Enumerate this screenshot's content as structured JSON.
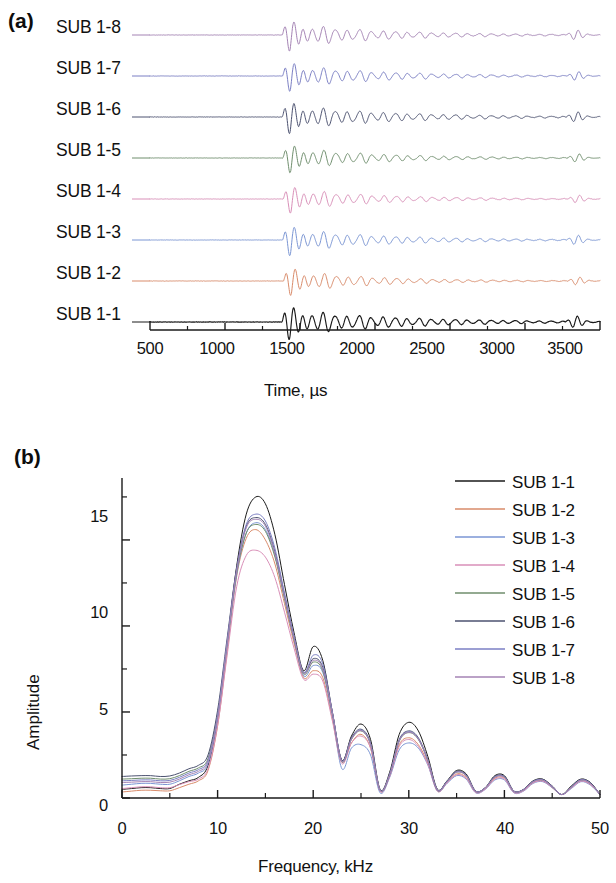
{
  "figure": {
    "panels": [
      {
        "id": "a",
        "label": "(a)",
        "type": "waveform-stack",
        "xlabel": "Time, µs",
        "x_ticks": [
          "500",
          "1000",
          "1500",
          "2000",
          "2500",
          "3000",
          "3500"
        ],
        "trace_labels": [
          "SUB 1-8",
          "SUB 1-7",
          "SUB 1-6",
          "SUB 1-5",
          "SUB 1-4",
          "SUB 1-3",
          "SUB 1-2",
          "SUB 1-1"
        ]
      },
      {
        "id": "b",
        "label": "(b)",
        "type": "spectrum",
        "xlabel": "Frequency, kHz",
        "ylabel": "Amplitude",
        "x_ticks": [
          "0",
          "10",
          "20",
          "30",
          "40",
          "50"
        ],
        "y_ticks": [
          "0",
          "5",
          "10",
          "15"
        ],
        "legend_labels": [
          "SUB 1-1",
          "SUB 1-2",
          "SUB 1-3",
          "SUB 1-4",
          "SUB 1-5",
          "SUB 1-6",
          "SUB 1-7",
          "SUB 1-8"
        ]
      }
    ]
  },
  "series_colors": {
    "SUB 1-1": "#1a1a1a",
    "SUB 1-2": "#d98b6a",
    "SUB 1-3": "#7b96d4",
    "SUB 1-4": "#d98fb8",
    "SUB 1-5": "#6f8e6d",
    "SUB 1-6": "#4c5270",
    "SUB 1-7": "#7b7fc4",
    "SUB 1-8": "#a483b4"
  },
  "chart_data": [
    {
      "type": "line",
      "panel": "a",
      "title": "(a)",
      "xlabel": "Time, µs",
      "ylabel": "",
      "xlim": [
        500,
        3500
      ],
      "xticks": [
        500,
        1000,
        1500,
        2000,
        2500,
        3000,
        3500
      ],
      "minor_xticks": [
        750,
        1250,
        1750,
        2250,
        2750,
        3250
      ],
      "grid": false,
      "legend": "none",
      "note": "Eight stacked ultrasonic A-scan waveforms, offset vertically; each trace is flat until a wave-packet arrival near 1380 µs, then a decaying coda, with a small reflection burst near 3300-3450 µs.",
      "series": [
        {
          "name": "SUB 1-8",
          "color": "#a483b4",
          "baseline_label_y": 25,
          "onset_us": 1380,
          "packet_peak_us": 1470,
          "peak_amp": 1.0,
          "coda_decay": 0.0016,
          "reflection_us": 3340,
          "reflection_amp": 0.17
        },
        {
          "name": "SUB 1-7",
          "color": "#7b7fc4",
          "baseline_label_y": 66,
          "onset_us": 1382,
          "packet_peak_us": 1472,
          "peak_amp": 0.96,
          "coda_decay": 0.0016,
          "reflection_us": 3345,
          "reflection_amp": 0.16
        },
        {
          "name": "SUB 1-6",
          "color": "#4c5270",
          "baseline_label_y": 107,
          "onset_us": 1380,
          "packet_peak_us": 1470,
          "peak_amp": 1.04,
          "coda_decay": 0.0015,
          "reflection_us": 3340,
          "reflection_amp": 0.18
        },
        {
          "name": "SUB 1-5",
          "color": "#6f8e6d",
          "baseline_label_y": 148,
          "onset_us": 1384,
          "packet_peak_us": 1474,
          "peak_amp": 0.92,
          "coda_decay": 0.0017,
          "reflection_us": 3348,
          "reflection_amp": 0.15
        },
        {
          "name": "SUB 1-4",
          "color": "#d98fb8",
          "baseline_label_y": 189,
          "onset_us": 1386,
          "packet_peak_us": 1476,
          "peak_amp": 0.88,
          "coda_decay": 0.0017,
          "reflection_us": 3350,
          "reflection_amp": 0.14
        },
        {
          "name": "SUB 1-3",
          "color": "#7b96d4",
          "baseline_label_y": 230,
          "onset_us": 1382,
          "packet_peak_us": 1472,
          "peak_amp": 0.98,
          "coda_decay": 0.0016,
          "reflection_us": 3342,
          "reflection_amp": 0.17
        },
        {
          "name": "SUB 1-2",
          "color": "#d98b6a",
          "baseline_label_y": 271,
          "onset_us": 1388,
          "packet_peak_us": 1478,
          "peak_amp": 0.9,
          "coda_decay": 0.0018,
          "reflection_us": 3352,
          "reflection_amp": 0.14
        },
        {
          "name": "SUB 1-1",
          "color": "#1a1a1a",
          "baseline_label_y": 312,
          "onset_us": 1378,
          "packet_peak_us": 1468,
          "peak_amp": 1.1,
          "coda_decay": 0.0014,
          "reflection_us": 3335,
          "reflection_amp": 0.2
        }
      ]
    },
    {
      "type": "line",
      "panel": "b",
      "title": "(b)",
      "xlabel": "Frequency, kHz",
      "ylabel": "Amplitude",
      "xlim": [
        0,
        50
      ],
      "ylim": [
        0,
        18.6
      ],
      "xticks": [
        0,
        10,
        20,
        30,
        40,
        50
      ],
      "minor_xticks": [
        5,
        15,
        25,
        35,
        45
      ],
      "yticks": [
        0,
        5,
        10,
        15
      ],
      "minor_yticks": [
        2.5,
        7.5,
        12.5,
        17.5
      ],
      "grid": false,
      "legend": "upper-right",
      "x": [
        0,
        1,
        2,
        3,
        4,
        5,
        6,
        7,
        8,
        9,
        10,
        11,
        12,
        13,
        14,
        15,
        16,
        17,
        18,
        19,
        20,
        21,
        22,
        23,
        24,
        25,
        26,
        27,
        28,
        29,
        30,
        31,
        32,
        33,
        34,
        35,
        36,
        37,
        38,
        39,
        40,
        41,
        42,
        43,
        44,
        45,
        46,
        47,
        48,
        49,
        50
      ],
      "series": [
        {
          "name": "SUB 1-1",
          "color": "#1a1a1a",
          "values": [
            0.5,
            0.55,
            0.6,
            0.6,
            0.55,
            0.55,
            0.8,
            1.0,
            1.2,
            1.9,
            4.6,
            9.0,
            13.5,
            16.5,
            17.5,
            17.1,
            15.3,
            12.4,
            9.6,
            7.4,
            8.8,
            8.0,
            5.0,
            2.2,
            3.6,
            4.3,
            3.4,
            0.5,
            1.5,
            3.7,
            4.4,
            3.9,
            2.4,
            0.5,
            1.0,
            1.6,
            1.4,
            0.4,
            0.6,
            1.3,
            1.3,
            0.4,
            0.5,
            1.0,
            1.1,
            0.7,
            0.2,
            0.7,
            1.1,
            0.9,
            0.2
          ]
        },
        {
          "name": "SUB 1-2",
          "color": "#d98b6a",
          "values": [
            0.35,
            0.4,
            0.45,
            0.45,
            0.42,
            0.42,
            0.6,
            0.8,
            1.0,
            1.6,
            4.2,
            8.5,
            12.9,
            15.1,
            15.6,
            15.0,
            13.6,
            11.3,
            9.0,
            7.0,
            7.4,
            7.0,
            4.6,
            2.1,
            3.2,
            3.7,
            2.9,
            0.4,
            1.3,
            3.1,
            3.5,
            3.1,
            2.0,
            0.4,
            0.9,
            1.4,
            1.2,
            0.35,
            0.55,
            1.15,
            1.15,
            0.35,
            0.45,
            0.9,
            1.0,
            0.6,
            0.2,
            0.6,
            1.0,
            0.8,
            0.2
          ]
        },
        {
          "name": "SUB 1-3",
          "color": "#7b96d4",
          "values": [
            0.75,
            0.8,
            0.85,
            0.85,
            0.8,
            0.8,
            1.0,
            1.25,
            1.45,
            2.0,
            4.6,
            8.8,
            13.0,
            15.4,
            16.0,
            15.6,
            14.1,
            11.6,
            9.2,
            7.1,
            7.7,
            7.3,
            4.8,
            1.7,
            2.9,
            3.1,
            2.5,
            0.3,
            1.2,
            2.8,
            3.2,
            2.9,
            1.9,
            0.4,
            0.85,
            1.3,
            1.1,
            0.3,
            0.5,
            1.05,
            1.05,
            0.3,
            0.4,
            0.85,
            0.95,
            0.6,
            0.2,
            0.55,
            0.95,
            0.75,
            0.2
          ]
        },
        {
          "name": "SUB 1-4",
          "color": "#d98fb8",
          "values": [
            0.55,
            0.6,
            0.65,
            0.65,
            0.6,
            0.6,
            0.78,
            0.95,
            1.1,
            1.7,
            4.2,
            8.3,
            12.3,
            14.1,
            14.4,
            14.0,
            12.8,
            10.8,
            8.7,
            6.9,
            7.2,
            6.8,
            4.5,
            2.0,
            3.2,
            3.6,
            2.9,
            0.4,
            1.25,
            3.0,
            3.4,
            3.0,
            1.95,
            0.4,
            0.88,
            1.35,
            1.15,
            0.32,
            0.52,
            1.1,
            1.1,
            0.32,
            0.42,
            0.88,
            0.98,
            0.62,
            0.2,
            0.58,
            0.98,
            0.78,
            0.2
          ]
        },
        {
          "name": "SUB 1-5",
          "color": "#6f8e6d",
          "values": [
            1.1,
            1.12,
            1.15,
            1.15,
            1.1,
            1.12,
            1.3,
            1.55,
            1.75,
            2.3,
            4.9,
            9.0,
            13.1,
            15.4,
            15.9,
            15.5,
            14.0,
            11.6,
            9.2,
            7.2,
            7.9,
            7.4,
            4.9,
            2.1,
            3.4,
            3.9,
            3.1,
            0.45,
            1.35,
            3.3,
            3.8,
            3.4,
            2.15,
            0.45,
            0.95,
            1.5,
            1.3,
            0.38,
            0.58,
            1.22,
            1.22,
            0.38,
            0.48,
            0.95,
            1.05,
            0.66,
            0.2,
            0.64,
            1.05,
            0.85,
            0.2
          ]
        },
        {
          "name": "SUB 1-6",
          "color": "#4c5270",
          "values": [
            1.25,
            1.28,
            1.3,
            1.3,
            1.25,
            1.28,
            1.45,
            1.7,
            1.9,
            2.5,
            5.1,
            9.3,
            13.4,
            15.8,
            16.3,
            15.9,
            14.3,
            11.8,
            9.3,
            7.3,
            8.1,
            7.6,
            5.0,
            2.2,
            3.5,
            4.0,
            3.2,
            0.47,
            1.4,
            3.4,
            3.9,
            3.5,
            2.2,
            0.47,
            0.98,
            1.55,
            1.35,
            0.4,
            0.6,
            1.25,
            1.25,
            0.4,
            0.5,
            0.98,
            1.08,
            0.68,
            0.2,
            0.66,
            1.08,
            0.88,
            0.2
          ]
        },
        {
          "name": "SUB 1-7",
          "color": "#7b7fc4",
          "values": [
            1.0,
            1.02,
            1.05,
            1.05,
            1.0,
            1.02,
            1.2,
            1.45,
            1.65,
            2.2,
            4.8,
            9.1,
            13.3,
            15.9,
            16.5,
            16.1,
            14.5,
            11.9,
            9.4,
            7.3,
            8.3,
            7.8,
            5.0,
            2.15,
            3.45,
            3.95,
            3.15,
            0.46,
            1.38,
            3.35,
            3.85,
            3.45,
            2.18,
            0.46,
            0.96,
            1.52,
            1.32,
            0.39,
            0.59,
            1.23,
            1.23,
            0.39,
            0.49,
            0.96,
            1.06,
            0.67,
            0.2,
            0.65,
            1.06,
            0.86,
            0.2
          ]
        },
        {
          "name": "SUB 1-8",
          "color": "#a483b4",
          "values": [
            0.9,
            0.92,
            0.95,
            0.95,
            0.9,
            0.92,
            1.1,
            1.35,
            1.55,
            2.1,
            4.7,
            9.0,
            13.2,
            15.7,
            16.2,
            15.8,
            14.2,
            11.7,
            9.25,
            7.25,
            8.0,
            7.5,
            4.95,
            2.12,
            3.42,
            3.92,
            3.12,
            0.45,
            1.36,
            3.32,
            3.82,
            3.42,
            2.16,
            0.45,
            0.94,
            1.5,
            1.3,
            0.38,
            0.58,
            1.2,
            1.2,
            0.38,
            0.48,
            0.94,
            1.04,
            0.66,
            0.2,
            0.63,
            1.04,
            0.84,
            0.2
          ]
        }
      ]
    }
  ]
}
